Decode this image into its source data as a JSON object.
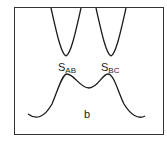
{
  "diagram": {
    "panel_label": "b",
    "saddle_labels": [
      {
        "main": "S",
        "sub": "AB"
      },
      {
        "main": "S",
        "sub": "BC"
      }
    ],
    "colors": {
      "line": "#1a1a1a",
      "background": "#ffffff"
    }
  }
}
